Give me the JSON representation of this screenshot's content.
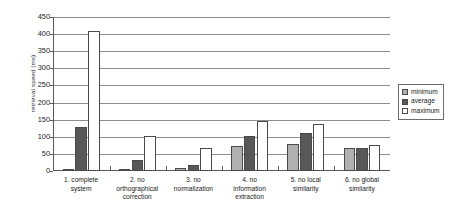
{
  "chart_data": {
    "type": "bar",
    "title": "",
    "subtitle": "",
    "xlabel": "",
    "ylabel": "retrieval speed  (ms)",
    "ylim": [
      0,
      450
    ],
    "ytick_step": 50,
    "yticks": [
      "450",
      "400",
      "350",
      "300",
      "250",
      "200",
      "150",
      "100",
      "50",
      "0"
    ],
    "grid": true,
    "legend_position": "right",
    "grouping": "grouped",
    "categories": [
      "1. complete system",
      "2. no orthographical correction",
      "3. no normalization",
      "4. no information extraction",
      "5. no local similarity",
      "6. no global similarity"
    ],
    "category_lines": [
      [
        "1. complete",
        "system"
      ],
      [
        "2. no",
        "orthographical",
        "correction"
      ],
      [
        "3. no",
        "normalization"
      ],
      [
        "4. no",
        "information",
        "extraction"
      ],
      [
        "5. no local",
        "similarity"
      ],
      [
        "6. no global",
        "similarity"
      ]
    ],
    "series": [
      {
        "name": "minimum",
        "color": "#b0b0b0",
        "values": [
          5,
          5,
          8,
          73,
          78,
          67
        ]
      },
      {
        "name": "average",
        "color": "#585858",
        "values": [
          130,
          33,
          18,
          103,
          110,
          68
        ]
      },
      {
        "name": "maximum",
        "color": "#ffffff",
        "values": [
          408,
          103,
          67,
          147,
          136,
          76
        ]
      }
    ]
  },
  "legend": {
    "items": [
      {
        "label": "minimum",
        "swatch": "minimum"
      },
      {
        "label": "average",
        "swatch": "average"
      },
      {
        "label": "maximum",
        "swatch": "maximum"
      }
    ]
  },
  "colors": {
    "minimum": "#b0b0b0",
    "average": "#585858",
    "maximum": "#ffffff",
    "axis": "#5a5a5a",
    "gridline": "#8d8d8d",
    "text": "#1a1a1a",
    "background": "#ffffff"
  }
}
